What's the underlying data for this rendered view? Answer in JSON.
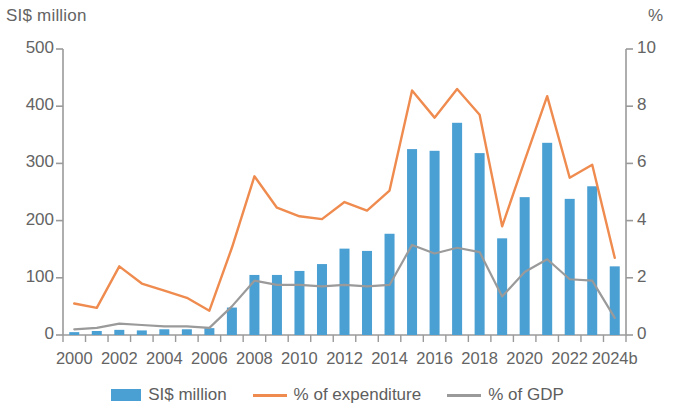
{
  "chart_data": {
    "type": "bar",
    "title": "",
    "subtitle": "",
    "xlabel": "",
    "ylabel": "SI$ million",
    "y2label": "%",
    "grid": false,
    "legend_position": "bottom",
    "ylim": [
      0,
      500
    ],
    "y2lim": [
      0,
      10
    ],
    "yticks": [
      "0",
      "100",
      "200",
      "300",
      "400",
      "500"
    ],
    "ytick_values": [
      0,
      100,
      200,
      300,
      400,
      500
    ],
    "y2ticks": [
      "0",
      "2",
      "4",
      "6",
      "8",
      "10"
    ],
    "y2tick_values": [
      0,
      2,
      4,
      6,
      8,
      10
    ],
    "categories": [
      "2000",
      "2001",
      "2002",
      "2003",
      "2004",
      "2005",
      "2006",
      "2007",
      "2008",
      "2009",
      "2010",
      "2011",
      "2012",
      "2013",
      "2014",
      "2015",
      "2016",
      "2017",
      "2018",
      "2019",
      "2020",
      "2021",
      "2022",
      "2023",
      "2024b"
    ],
    "xtick_labels": [
      "2000",
      "2002",
      "2004",
      "2006",
      "2008",
      "2010",
      "2012",
      "2014",
      "2016",
      "2018",
      "2020",
      "2022",
      "2024b"
    ],
    "xtick_categories": [
      "2000",
      "2002",
      "2004",
      "2006",
      "2008",
      "2010",
      "2012",
      "2014",
      "2016",
      "2018",
      "2020",
      "2022",
      "2024b"
    ],
    "series": [
      {
        "name": "SI$ million",
        "type": "bar",
        "axis": "left",
        "color": "#4a9fd3",
        "values": [
          5,
          7,
          9,
          8,
          10,
          10,
          12,
          48,
          105,
          105,
          112,
          124,
          151,
          147,
          177,
          325,
          322,
          371,
          318,
          169,
          241,
          336,
          238,
          260,
          120
        ]
      },
      {
        "name": "% of expenditure",
        "type": "line",
        "axis": "right",
        "color": "#ef8b4e",
        "values": [
          1.1,
          0.95,
          2.4,
          1.8,
          1.55,
          1.3,
          0.85,
          3.05,
          5.55,
          4.45,
          4.15,
          4.05,
          4.65,
          4.35,
          5.05,
          8.55,
          7.6,
          8.6,
          7.7,
          3.8,
          6.1,
          8.35,
          5.5,
          5.95,
          2.7
        ]
      },
      {
        "name": "% of GDP",
        "type": "line",
        "axis": "right",
        "color": "#9a9a9a",
        "values": [
          0.2,
          0.25,
          0.4,
          0.35,
          0.3,
          0.3,
          0.25,
          1.0,
          1.9,
          1.75,
          1.75,
          1.7,
          1.75,
          1.7,
          1.75,
          3.15,
          2.85,
          3.05,
          2.9,
          1.35,
          2.2,
          2.65,
          1.95,
          1.9,
          0.6
        ]
      }
    ]
  },
  "legend": {
    "items": [
      {
        "label": "SI$ million",
        "kind": "bar",
        "color": "#4a9fd3"
      },
      {
        "label": "% of expenditure",
        "kind": "line",
        "color": "#ef8b4e"
      },
      {
        "label": "% of GDP",
        "kind": "line",
        "color": "#9a9a9a"
      }
    ]
  },
  "axes": {
    "left_unit": "SI$ million",
    "right_unit": "%"
  }
}
